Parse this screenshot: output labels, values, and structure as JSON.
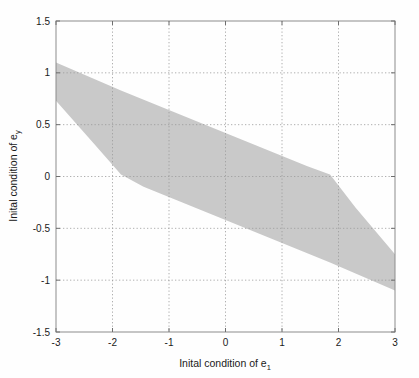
{
  "figure": {
    "background_color": "#fefefe",
    "plot_box": {
      "left": 56,
      "top": 21,
      "right": 395,
      "bottom": 332
    },
    "border_color": "#8c8c8c",
    "grid_color": "#9a9a9a"
  },
  "chart_data": {
    "type": "area",
    "title": "",
    "subtitle": "",
    "xlabel": "Inital condition of e",
    "xlabel_sub": "1",
    "ylabel": "Inital condition of e",
    "ylabel_sub": "y",
    "xlim": [
      -3,
      3
    ],
    "ylim": [
      -1.5,
      1.5
    ],
    "xticks": [
      -3,
      -2,
      -1,
      0,
      1,
      2,
      3
    ],
    "xticklabels": [
      "-3",
      "-2",
      "-1",
      "0",
      "1",
      "2",
      "3"
    ],
    "yticks": [
      -1.5,
      -1,
      -0.5,
      0,
      0.5,
      1,
      1.5
    ],
    "yticklabels": [
      "-1.5",
      "-1",
      "-0.5",
      "0",
      "0.5",
      "1",
      "1.5"
    ],
    "grid": true,
    "grid_style": "dotted",
    "legend": null,
    "legend_position": "none",
    "series": [
      {
        "name": "region of attraction",
        "kind": "filled-band",
        "fill_color": "#c9c9c9",
        "upper_boundary": [
          {
            "x": -3.0,
            "y": 1.1
          },
          {
            "x": -1.85,
            "y": 0.83
          },
          {
            "x": 0.0,
            "y": 0.42
          },
          {
            "x": 1.45,
            "y": 0.1
          },
          {
            "x": 1.85,
            "y": 0.02
          },
          {
            "x": 2.3,
            "y": -0.3
          },
          {
            "x": 3.0,
            "y": -0.75
          }
        ],
        "lower_boundary": [
          {
            "x": -3.0,
            "y": 0.73
          },
          {
            "x": -2.3,
            "y": 0.3
          },
          {
            "x": -1.85,
            "y": 0.02
          },
          {
            "x": -1.45,
            "y": -0.1
          },
          {
            "x": 0.0,
            "y": -0.42
          },
          {
            "x": 1.85,
            "y": -0.83
          },
          {
            "x": 3.0,
            "y": -1.1
          }
        ]
      }
    ]
  }
}
